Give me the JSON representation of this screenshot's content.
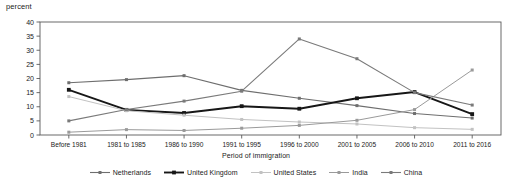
{
  "chart_data": {
    "type": "line",
    "title": "",
    "subtitle": "",
    "xlabel": "Period of immigration",
    "ylabel": "percent",
    "ylim": [
      0,
      40
    ],
    "ytick_step": 5,
    "yticks": [
      "0",
      "5",
      "10",
      "15",
      "20",
      "25",
      "30",
      "35",
      "40"
    ],
    "grid": false,
    "legend_position": "bottom",
    "categories": [
      "Before 1981",
      "1981 to 1985",
      "1986 to 1990",
      "1991 to 1995",
      "1996 to 2000",
      "2001 to 2005",
      "2006 to 2010",
      "2011 to 2016"
    ],
    "series": [
      {
        "name": "Netherlands",
        "color": "#6e6e6e",
        "width": 1.1,
        "marker": "square",
        "values": [
          18.5,
          19.6,
          21.0,
          15.8,
          13.0,
          10.4,
          7.6,
          6.0
        ]
      },
      {
        "name": "United Kingdom",
        "color": "#171717",
        "width": 1.9,
        "marker": "square",
        "values": [
          16.0,
          8.9,
          7.8,
          10.2,
          9.3,
          13.0,
          15.2,
          7.4
        ]
      },
      {
        "name": "United States",
        "color": "#c2c2c2",
        "width": 1.0,
        "marker": "square",
        "values": [
          13.6,
          8.6,
          7.0,
          5.5,
          4.6,
          3.9,
          2.6,
          2.0
        ]
      },
      {
        "name": "India",
        "color": "#9a9a9a",
        "width": 1.0,
        "marker": "square",
        "values": [
          1.0,
          1.9,
          1.6,
          2.4,
          3.4,
          5.2,
          9.0,
          23.0
        ]
      },
      {
        "name": "China",
        "color": "#7a7a7a",
        "width": 1.1,
        "marker": "square",
        "values": [
          5.0,
          9.0,
          12.0,
          15.5,
          34.0,
          27.0,
          15.0,
          10.6
        ]
      }
    ]
  },
  "legend": {
    "items": [
      {
        "label": "Netherlands"
      },
      {
        "label": "United Kingdom"
      },
      {
        "label": "United States"
      },
      {
        "label": "India"
      },
      {
        "label": "China"
      }
    ]
  }
}
